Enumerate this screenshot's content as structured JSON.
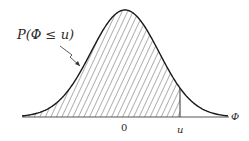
{
  "diagram": {
    "type": "normal-distribution-cdf",
    "labels": {
      "probability": "P(Φ ≤ u)",
      "origin": "0",
      "u": "u",
      "axis": "Φ"
    },
    "colors": {
      "curve": "#1a1a1a",
      "hatch": "#3a3a3a",
      "axis": "#555555"
    },
    "geometry": {
      "baseline_y": 117,
      "x_start": 22,
      "x_end": 228,
      "peak_x": 125,
      "peak_y": 10,
      "u_x": 180
    }
  }
}
